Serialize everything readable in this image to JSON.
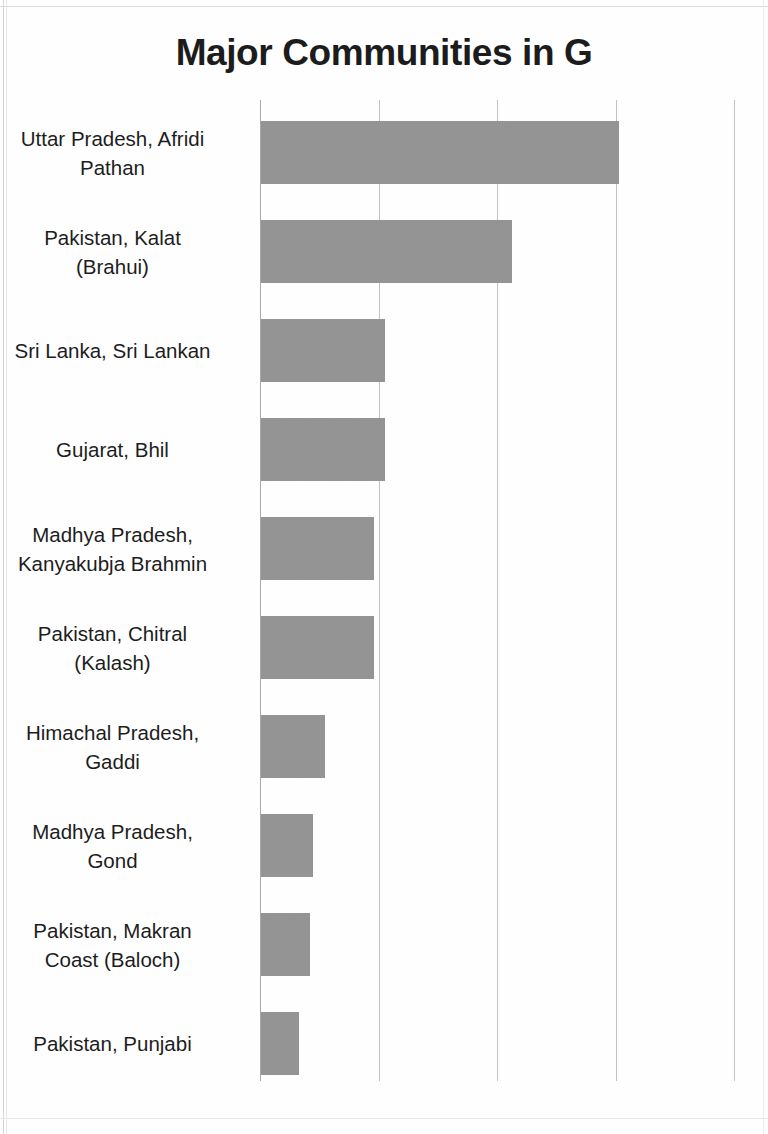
{
  "document": {
    "title": "Major Communities in G",
    "title_truncated": true
  },
  "chart_data": {
    "type": "bar",
    "orientation": "horizontal",
    "title": "Major Communities in G",
    "xlabel": "",
    "ylabel": "",
    "grid": true,
    "legend": false,
    "legend_position": "none",
    "bar_color": "#959595",
    "gridline_color": "#c2c2c2",
    "axis_color": "#a8a8a8",
    "x_gridline_count": 5,
    "xlim": [
      0,
      4
    ],
    "x_tick_values": [
      0,
      1,
      2,
      3,
      4
    ],
    "x_tick_labels": [
      "",
      "",
      "",
      "",
      ""
    ],
    "categories": [
      "Uttar Pradesh, Afridi Pathan",
      "Pakistan, Kalat (Brahui)",
      "Sri Lanka, Sri Lankan",
      "Gujarat, Bhil",
      "Madhya Pradesh, Kanyakubja Brahmin",
      "Pakistan, Chitral (Kalash)",
      "Himachal Pradesh, Gaddi",
      "Madhya Pradesh, Gond",
      "Pakistan, Makran Coast (Baloch)",
      "Pakistan, Punjabi"
    ],
    "values": [
      3.02,
      2.12,
      1.05,
      1.05,
      0.95,
      0.95,
      0.54,
      0.44,
      0.41,
      0.32
    ]
  },
  "bars": [
    {
      "label_lines": [
        "Uttar Pradesh, Afridi",
        "Pathan"
      ],
      "value": 3.02
    },
    {
      "label_lines": [
        "Pakistan, Kalat",
        "(Brahui)"
      ],
      "value": 2.12
    },
    {
      "label_lines": [
        "Sri Lanka, Sri Lankan"
      ],
      "value": 1.05
    },
    {
      "label_lines": [
        "Gujarat, Bhil"
      ],
      "value": 1.05
    },
    {
      "label_lines": [
        "Madhya Pradesh,",
        "Kanyakubja Brahmin"
      ],
      "value": 0.95
    },
    {
      "label_lines": [
        "Pakistan, Chitral",
        "(Kalash)"
      ],
      "value": 0.95
    },
    {
      "label_lines": [
        "Himachal Pradesh,",
        "Gaddi"
      ],
      "value": 0.54
    },
    {
      "label_lines": [
        "Madhya Pradesh,",
        "Gond"
      ],
      "value": 0.44
    },
    {
      "label_lines": [
        "Pakistan, Makran",
        "Coast (Baloch)"
      ],
      "value": 0.41
    },
    {
      "label_lines": [
        "Pakistan, Punjabi"
      ],
      "value": 0.32
    }
  ],
  "layout": {
    "axis_x": 260,
    "gridline_spacing": 118.5,
    "first_bar_top": 121,
    "bar_pitch": 99,
    "bar_height": 63
  }
}
